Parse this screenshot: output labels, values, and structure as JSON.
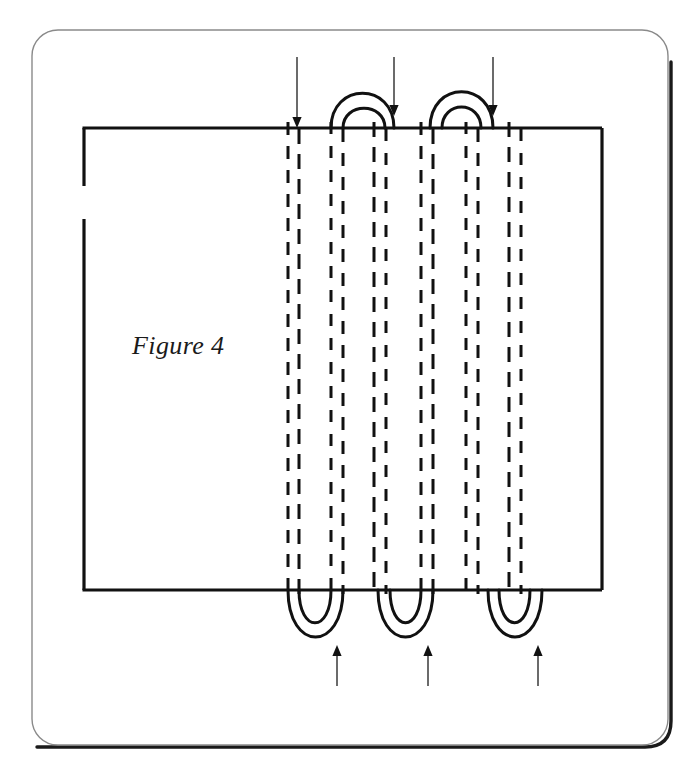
{
  "figure": {
    "caption": "Figure 4",
    "caption_position": {
      "x": 132,
      "y": 354
    },
    "ink_color": "#111111",
    "card_border_color": "#8a8a8a",
    "card_shadow_color": "#1a1a1a",
    "background_color": "#ffffff",
    "card": {
      "name": "page-card",
      "x": 32,
      "y": 30,
      "width": 636,
      "height": 715,
      "corner_radius": 26
    },
    "fabric_rectangle": {
      "name": "fabric-outline",
      "x": 84,
      "y": 128,
      "width": 518,
      "height": 462,
      "left_edge_gap": {
        "start_y": 186,
        "end_y": 219
      }
    },
    "stitch_lines": [
      {
        "name": "stitch-line-1",
        "x": 288
      },
      {
        "name": "stitch-line-2",
        "x": 299
      },
      {
        "name": "stitch-line-3",
        "x": 331
      },
      {
        "name": "stitch-line-4",
        "x": 343
      },
      {
        "name": "stitch-line-5",
        "x": 374
      },
      {
        "name": "stitch-line-6",
        "x": 386
      },
      {
        "name": "stitch-line-7",
        "x": 421
      },
      {
        "name": "stitch-line-8",
        "x": 433
      },
      {
        "name": "stitch-line-9",
        "x": 466
      },
      {
        "name": "stitch-line-10",
        "x": 478
      },
      {
        "name": "stitch-line-11",
        "x": 509
      },
      {
        "name": "stitch-line-12",
        "x": 521
      }
    ],
    "stitch_span": {
      "top_y": 128,
      "bottom_y": 590
    },
    "top_loops": [
      {
        "name": "top-loop-1",
        "outer_left": 331,
        "outer_right": 394,
        "inner_left": 343,
        "inner_right": 385,
        "outer_top": 88,
        "inner_top": 106
      },
      {
        "name": "top-loop-2",
        "outer_left": 430,
        "outer_right": 493,
        "inner_left": 442,
        "inner_right": 481,
        "outer_top": 86,
        "inner_top": 104
      }
    ],
    "bottom_loops": [
      {
        "name": "bottom-loop-1",
        "outer_left": 288,
        "outer_right": 343,
        "inner_left": 299,
        "inner_right": 331,
        "outer_bottom": 645,
        "inner_bottom": 628
      },
      {
        "name": "bottom-loop-2",
        "outer_left": 378,
        "outer_right": 433,
        "inner_left": 390,
        "inner_right": 421,
        "outer_bottom": 645,
        "inner_bottom": 628
      },
      {
        "name": "bottom-loop-3",
        "outer_left": 488,
        "outer_right": 542,
        "inner_left": 499,
        "inner_right": 530,
        "outer_bottom": 645,
        "inner_bottom": 628
      }
    ],
    "top_arrows": [
      {
        "name": "arrow-down-1",
        "x": 297,
        "from_y": 57,
        "to_y": 128
      },
      {
        "name": "arrow-down-2",
        "x": 394,
        "from_y": 57,
        "to_y": 116
      },
      {
        "name": "arrow-down-3",
        "x": 493,
        "from_y": 57,
        "to_y": 116
      }
    ],
    "bottom_arrows": [
      {
        "name": "arrow-up-1",
        "x": 337,
        "from_y": 686,
        "to_y": 645
      },
      {
        "name": "arrow-up-2",
        "x": 428,
        "from_y": 686,
        "to_y": 645
      },
      {
        "name": "arrow-up-3",
        "x": 538,
        "from_y": 686,
        "to_y": 645
      }
    ]
  }
}
